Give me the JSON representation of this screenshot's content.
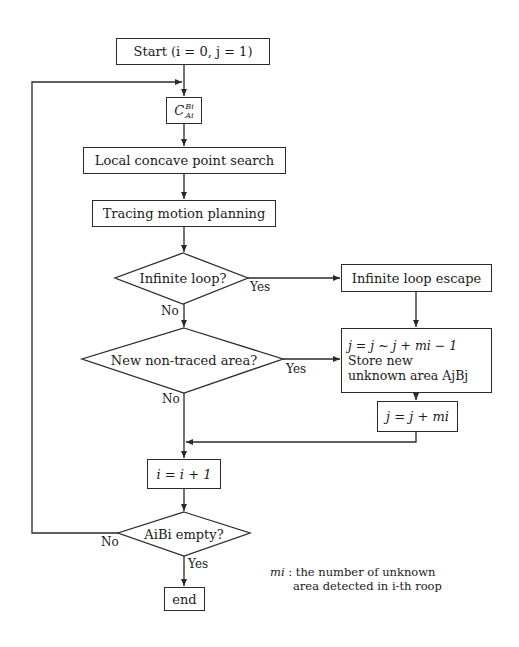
{
  "diagram": {
    "type": "flowchart",
    "nodes": {
      "start": {
        "shape": "process",
        "label": "Start (i = 0, j = 1)"
      },
      "cspace": {
        "shape": "process",
        "label": "C",
        "sup": "Bi",
        "sub": "Ai"
      },
      "local_search": {
        "shape": "process",
        "label": "Local concave point search"
      },
      "tracing": {
        "shape": "process",
        "label": "Tracing motion planning"
      },
      "infinite_loop": {
        "shape": "decision",
        "label": "Infinite loop?"
      },
      "escape": {
        "shape": "process",
        "label": "Infinite loop escape"
      },
      "new_area": {
        "shape": "decision",
        "label": "New non-traced area?"
      },
      "store": {
        "shape": "process",
        "line1": "j = j ~ j + mi − 1",
        "line2": "Store new",
        "line3": "unknown area AjBj"
      },
      "j_update": {
        "shape": "process",
        "label": "j = j + mi"
      },
      "i_update": {
        "shape": "process",
        "label": "i = i + 1"
      },
      "empty_check": {
        "shape": "decision",
        "label": "AiBi empty?"
      },
      "end": {
        "shape": "terminal",
        "label": "end"
      }
    },
    "edge_labels": {
      "infinite_yes": "Yes",
      "infinite_no": "No",
      "new_yes": "Yes",
      "new_no": "No",
      "empty_no": "No",
      "empty_yes": "Yes"
    },
    "note": {
      "symbol": "mi",
      "line1": ": the number of unknown",
      "line2": "area detected in i-th roop"
    },
    "colors": {
      "stroke": "#2a2a2a",
      "background": "#ffffff",
      "text": "#1a1a1a"
    }
  }
}
